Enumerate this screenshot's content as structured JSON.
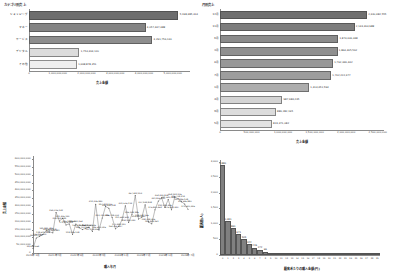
{
  "dashboard": {
    "layout": "2x2 grid of statistical charts",
    "background": "#ffffff"
  },
  "chart_data": [
    {
      "id": "top-left",
      "type": "bar",
      "orientation": "horizontal",
      "title": "カテゴリ別売上",
      "xlabel": "売上金額",
      "ylabel": "",
      "categories": [
        "ショッピング",
        "マネー",
        "サービス",
        "デジタル",
        "その他"
      ],
      "values": [
        5198385413,
        4057447488,
        4291756161,
        1754364120,
        1668878351
      ],
      "value_labels": [
        "5,198,385,413",
        "4,057,447,488",
        "4,291,756,161",
        "1,754,364,120",
        "1,668,878,351"
      ],
      "xticks": [
        0,
        1000000000,
        2000000000,
        3000000000,
        4000000000,
        5000000000
      ],
      "xticklabels": [
        "0",
        "1,000,000,000",
        "2,000,000,000",
        "3,000,000,000",
        "4,000,000,000",
        "5,000,000,000"
      ],
      "xlim": [
        0,
        5600000000
      ],
      "grid": false,
      "bar_colors": [
        "#6d6d6d",
        "#848484",
        "#8e8e8e",
        "#dcdcdc",
        "#efefef"
      ]
    },
    {
      "id": "top-right",
      "type": "bar",
      "orientation": "horizontal",
      "title": "月別売上",
      "xlabel": "売上金額",
      "ylabel": "",
      "categories": [
        "12月",
        "11月",
        "6月",
        "3月",
        "8月",
        "7月",
        "1月",
        "4月",
        "9月",
        "5月"
      ],
      "values": [
        2330482555,
        2134364988,
        1874446448,
        1864465562,
        1792346442,
        1762222477,
        1413451593,
        987683235,
        886282195,
        823371082
      ],
      "value_labels": [
        "2,330,482,555",
        "2,134,364,988",
        "1,874,446,448",
        "1,864,465,562",
        "1,792,346,442",
        "1,762,222,477",
        "1,413,451,593",
        "987,683,235",
        "886,282,195",
        "823,371,082"
      ],
      "xticks": [
        0,
        500000000,
        1000000000,
        1500000000,
        2000000000,
        2500000000
      ],
      "xticklabels": [
        "0",
        "500,000,000",
        "1,000,000,000",
        "1,500,000,000",
        "2,000,000,000",
        "2,500,000,000"
      ],
      "xlim": [
        0,
        2600000000
      ],
      "grid": false,
      "bar_colors": [
        "#6f6f6f",
        "#7d7d7d",
        "#8b8b8b",
        "#8f8f8f",
        "#989898",
        "#9d9d9d",
        "#adadad",
        "#d4d4d4",
        "#dcdcdc",
        "#e2e2e2"
      ]
    },
    {
      "id": "bottom-left",
      "type": "line",
      "title": "",
      "xlabel": "購入年月",
      "ylabel": "売上金額",
      "x": [
        "2021年1月",
        "2021年2月",
        "2021年3月",
        "2021年4月",
        "2021年5月",
        "2021年6月",
        "2021年7月",
        "2021年8月",
        "2021年9月",
        "2021年10月",
        "2021年11月",
        "2021年12月",
        "2022年1月",
        "2022年2月",
        "2022年3月",
        "2022年4月",
        "2022年5月",
        "2022年6月",
        "2022年7月",
        "2022年8月",
        "2022年9月",
        "2022年10月",
        "2022年11月",
        "2022年12月",
        "2023年1月",
        "2023年2月",
        "2023年3月",
        "2023年4月",
        "2023年5月",
        "2023年6月",
        "2023年7月",
        "2023年8月",
        "2023年9月",
        "2023年10月",
        "2023年11月",
        "2023年12月",
        "2024年1月",
        "2024年2月",
        "2024年3月",
        "2024年4月",
        "2024年5月",
        "2024年6月",
        "2024年7月",
        "2024年8月",
        "2024年9月",
        "2024年10月",
        "2024年11月",
        "2024年12月"
      ],
      "xticklabels": [
        "2021年1月",
        "2021年7月",
        "2022年1月",
        "2022年7月",
        "2023年1月",
        "2023年7月",
        "2024年1月",
        "2024年7月"
      ],
      "values": [
        28400000,
        96500000,
        106200000,
        118600000,
        141800000,
        134600000,
        128900000,
        259000000,
        204900000,
        221400000,
        179500000,
        186100000,
        118900000,
        185300000,
        161200000,
        149700000,
        158600000,
        163800000,
        137700000,
        312300000,
        146600000,
        223700000,
        297400000,
        286300000,
        226700000,
        154400000,
        170400000,
        211600000,
        301500000,
        194900000,
        246900000,
        367400000,
        216800000,
        228000000,
        307900000,
        198300000,
        186400000,
        276800000,
        331800000,
        352400000,
        291200000,
        341600000,
        276500000,
        358100000,
        346700000,
        327800000,
        312500000,
        279600000
      ],
      "point_labels": [
        "28,448,564",
        "96,522,380",
        "106,206,600",
        "118,619,482",
        "141,849,386",
        "134,618,208",
        "128,936,881",
        "259,016,142",
        "204,903,449",
        "221,406,130",
        "179,506,245",
        "186,128,540",
        "118,936,108",
        "185,301,264",
        "161,240,807",
        "149,703,168",
        "158,642,031",
        "163,806,546",
        "137,708,462",
        "312,336,840",
        "146,613,026",
        "223,744,086",
        "297,418,206",
        "286,344,008",
        "226,718,003",
        "154,406,337",
        "170,448,120",
        "211,642,504",
        "301,506,114",
        "194,903,340",
        "246,938,286",
        "367,442,203",
        "216,840,460",
        "228,042,166",
        "307,934,808",
        "198,308,406",
        "186,448,261",
        "276,830,462",
        "331,806,420",
        "352,440,808",
        "291,208,446",
        "341,620,364",
        "276,508,340",
        "358,142,206",
        "346,708,214",
        "327,846,108",
        "312,546,880",
        "279,620,346"
      ],
      "yticks": [
        0,
        50000000,
        100000000,
        150000000,
        200000000,
        250000000,
        300000000,
        350000000,
        400000000,
        450000000,
        500000000,
        550000000,
        600000000
      ],
      "yticklabels": [
        "0",
        "50,000,000",
        "100,000,000",
        "150,000,000",
        "200,000,000",
        "250,000,000",
        "300,000,000",
        "350,000,000",
        "400,000,000",
        "450,000,000",
        "500,000,000",
        "550,000,000",
        "600,000,000"
      ],
      "ylim": [
        0,
        620000000
      ],
      "grid": false,
      "line_color": "#555555",
      "marker_color": "#555555"
    },
    {
      "id": "bottom-right",
      "type": "bar",
      "orientation": "vertical",
      "title": "",
      "xlabel": "顧客あたりの購入金額(円)",
      "ylabel": "顧客数(人)",
      "categories": [
        "0",
        "1",
        "2",
        "3",
        "4",
        "5",
        "6",
        "7",
        "8",
        "9",
        "10",
        "11",
        "12",
        "13",
        "14",
        "15",
        "16",
        "17",
        "18",
        "19",
        "20",
        "21",
        "22",
        "23",
        "24",
        "25",
        "26",
        "27",
        "28",
        "29"
      ],
      "values": [
        2880,
        1081,
        861,
        671,
        505,
        344,
        226,
        172,
        96,
        63,
        41,
        27,
        18,
        12,
        8,
        6,
        4,
        3,
        2,
        2,
        1,
        1,
        1,
        0,
        0,
        0,
        0,
        0,
        0,
        1
      ],
      "value_labels": [
        "2,880",
        "1,081",
        "861",
        "671",
        "505",
        "344",
        "226",
        "172",
        "96",
        "",
        "",
        "",
        "",
        "",
        "",
        "",
        "",
        "",
        "",
        "",
        "",
        "",
        "",
        "",
        "",
        "",
        "",
        "",
        "",
        ""
      ],
      "yticks": [
        0,
        500,
        1000,
        1500,
        2000,
        2500,
        3000
      ],
      "yticklabels": [
        "0",
        "500",
        "1,000",
        "1,500",
        "2,000",
        "2,500",
        "3,000"
      ],
      "ylim": [
        0,
        3050
      ],
      "grid": false,
      "bar_color": "#808080"
    }
  ]
}
